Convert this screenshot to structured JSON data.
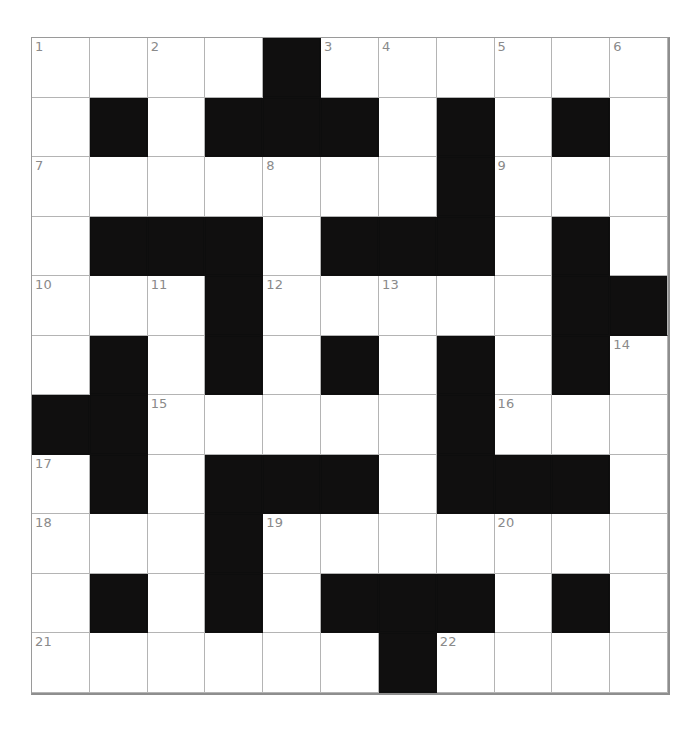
{
  "page": {
    "background_color": "#ffffff"
  },
  "grid": {
    "rows": 11,
    "columns": 11,
    "cell_fill_color": "#ffffff",
    "block_color": "#100f0f",
    "grid_line_color": "#b4b4b4",
    "border_color": "#8e8e8e",
    "number_color": "#8a8a8a",
    "total_clue_numbers": 22,
    "cells": [
      [
        {
          "type": "open",
          "number": "1"
        },
        {
          "type": "open",
          "number": ""
        },
        {
          "type": "open",
          "number": "2"
        },
        {
          "type": "open",
          "number": ""
        },
        {
          "type": "block",
          "number": ""
        },
        {
          "type": "open",
          "number": "3"
        },
        {
          "type": "open",
          "number": "4"
        },
        {
          "type": "open",
          "number": ""
        },
        {
          "type": "open",
          "number": "5"
        },
        {
          "type": "open",
          "number": ""
        },
        {
          "type": "open",
          "number": "6"
        }
      ],
      [
        {
          "type": "open",
          "number": ""
        },
        {
          "type": "block",
          "number": ""
        },
        {
          "type": "open",
          "number": ""
        },
        {
          "type": "block",
          "number": ""
        },
        {
          "type": "block",
          "number": ""
        },
        {
          "type": "block",
          "number": ""
        },
        {
          "type": "open",
          "number": ""
        },
        {
          "type": "block",
          "number": ""
        },
        {
          "type": "open",
          "number": ""
        },
        {
          "type": "block",
          "number": ""
        },
        {
          "type": "open",
          "number": ""
        }
      ],
      [
        {
          "type": "open",
          "number": "7"
        },
        {
          "type": "open",
          "number": ""
        },
        {
          "type": "open",
          "number": ""
        },
        {
          "type": "open",
          "number": ""
        },
        {
          "type": "open",
          "number": "8"
        },
        {
          "type": "open",
          "number": ""
        },
        {
          "type": "open",
          "number": ""
        },
        {
          "type": "block",
          "number": ""
        },
        {
          "type": "open",
          "number": "9"
        },
        {
          "type": "open",
          "number": ""
        },
        {
          "type": "open",
          "number": ""
        }
      ],
      [
        {
          "type": "open",
          "number": ""
        },
        {
          "type": "block",
          "number": ""
        },
        {
          "type": "block",
          "number": ""
        },
        {
          "type": "block",
          "number": ""
        },
        {
          "type": "open",
          "number": ""
        },
        {
          "type": "block",
          "number": ""
        },
        {
          "type": "block",
          "number": ""
        },
        {
          "type": "block",
          "number": ""
        },
        {
          "type": "open",
          "number": ""
        },
        {
          "type": "block",
          "number": ""
        },
        {
          "type": "open",
          "number": ""
        }
      ],
      [
        {
          "type": "open",
          "number": "10"
        },
        {
          "type": "open",
          "number": ""
        },
        {
          "type": "open",
          "number": "11"
        },
        {
          "type": "block",
          "number": ""
        },
        {
          "type": "open",
          "number": "12"
        },
        {
          "type": "open",
          "number": ""
        },
        {
          "type": "open",
          "number": "13"
        },
        {
          "type": "open",
          "number": ""
        },
        {
          "type": "open",
          "number": ""
        },
        {
          "type": "block",
          "number": ""
        },
        {
          "type": "block",
          "number": ""
        }
      ],
      [
        {
          "type": "open",
          "number": ""
        },
        {
          "type": "block",
          "number": ""
        },
        {
          "type": "open",
          "number": ""
        },
        {
          "type": "block",
          "number": ""
        },
        {
          "type": "open",
          "number": ""
        },
        {
          "type": "block",
          "number": ""
        },
        {
          "type": "open",
          "number": ""
        },
        {
          "type": "block",
          "number": ""
        },
        {
          "type": "open",
          "number": ""
        },
        {
          "type": "block",
          "number": ""
        },
        {
          "type": "open",
          "number": "14"
        }
      ],
      [
        {
          "type": "block",
          "number": ""
        },
        {
          "type": "block",
          "number": ""
        },
        {
          "type": "open",
          "number": "15"
        },
        {
          "type": "open",
          "number": ""
        },
        {
          "type": "open",
          "number": ""
        },
        {
          "type": "open",
          "number": ""
        },
        {
          "type": "open",
          "number": ""
        },
        {
          "type": "block",
          "number": ""
        },
        {
          "type": "open",
          "number": "16"
        },
        {
          "type": "open",
          "number": ""
        },
        {
          "type": "open",
          "number": ""
        }
      ],
      [
        {
          "type": "open",
          "number": "17"
        },
        {
          "type": "block",
          "number": ""
        },
        {
          "type": "open",
          "number": ""
        },
        {
          "type": "block",
          "number": ""
        },
        {
          "type": "block",
          "number": ""
        },
        {
          "type": "block",
          "number": ""
        },
        {
          "type": "open",
          "number": ""
        },
        {
          "type": "block",
          "number": ""
        },
        {
          "type": "block",
          "number": ""
        },
        {
          "type": "block",
          "number": ""
        },
        {
          "type": "open",
          "number": ""
        }
      ],
      [
        {
          "type": "open",
          "number": "18"
        },
        {
          "type": "open",
          "number": ""
        },
        {
          "type": "open",
          "number": ""
        },
        {
          "type": "block",
          "number": ""
        },
        {
          "type": "open",
          "number": "19"
        },
        {
          "type": "open",
          "number": ""
        },
        {
          "type": "open",
          "number": ""
        },
        {
          "type": "open",
          "number": ""
        },
        {
          "type": "open",
          "number": "20"
        },
        {
          "type": "open",
          "number": ""
        },
        {
          "type": "open",
          "number": ""
        }
      ],
      [
        {
          "type": "open",
          "number": ""
        },
        {
          "type": "block",
          "number": ""
        },
        {
          "type": "open",
          "number": ""
        },
        {
          "type": "block",
          "number": ""
        },
        {
          "type": "open",
          "number": ""
        },
        {
          "type": "block",
          "number": ""
        },
        {
          "type": "block",
          "number": ""
        },
        {
          "type": "block",
          "number": ""
        },
        {
          "type": "open",
          "number": ""
        },
        {
          "type": "block",
          "number": ""
        },
        {
          "type": "open",
          "number": ""
        }
      ],
      [
        {
          "type": "open",
          "number": "21"
        },
        {
          "type": "open",
          "number": ""
        },
        {
          "type": "open",
          "number": ""
        },
        {
          "type": "open",
          "number": ""
        },
        {
          "type": "open",
          "number": ""
        },
        {
          "type": "open",
          "number": ""
        },
        {
          "type": "block",
          "number": ""
        },
        {
          "type": "open",
          "number": "22"
        },
        {
          "type": "open",
          "number": ""
        },
        {
          "type": "open",
          "number": ""
        },
        {
          "type": "open",
          "number": ""
        }
      ]
    ]
  }
}
